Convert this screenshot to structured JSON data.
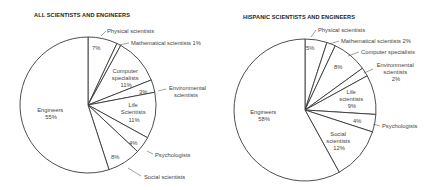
{
  "chart_data": [
    {
      "type": "pie",
      "title": "ALL SCIENTISTS AND ENGINEERS",
      "start": "12 o'clock, clockwise",
      "categories": [
        "Physical scientists",
        "Mathematical scientists",
        "Computer specialists",
        "Environmental scientists",
        "Life Scientists",
        "Psychologists",
        "Social scientists",
        "Engineers"
      ],
      "values": [
        7,
        1,
        11,
        3,
        11,
        4,
        8,
        55
      ],
      "value_labels": [
        "7%",
        "1%",
        "11%",
        "3%",
        "11%",
        "4%",
        "8%",
        "55%"
      ]
    },
    {
      "type": "pie",
      "title": "HISPANIC SCIENTISTS AND ENGINEERS",
      "start": "12 o'clock, clockwise",
      "categories": [
        "Physical scientists",
        "Mathematical scientists",
        "Computer specialists",
        "Environmental scientists",
        "Life scientists",
        "Psychologists",
        "Social scientists",
        "Engineers"
      ],
      "values": [
        5,
        2,
        8,
        2,
        9,
        4,
        12,
        58
      ],
      "value_labels": [
        "5%",
        "2%",
        "8%",
        "2%",
        "9%",
        "4%",
        "12%",
        "58%"
      ]
    }
  ],
  "left": {
    "title": "ALL SCIENTISTS AND ENGINEERS",
    "labels": {
      "physical": "Physical scientists",
      "physical_pct": "7%",
      "math": "Mathematical scientists 1%",
      "computer_1": "Computer",
      "computer_2": "specialists",
      "computer_pct": "11%",
      "env_pct": "3%",
      "env_1": "Environmental",
      "env_2": "scientists",
      "life_1": "Life",
      "life_2": "Scientists",
      "life_pct": "11%",
      "psych_pct": "4%",
      "psych": "Psychologists",
      "social_pct": "8%",
      "social": "Social scientists",
      "eng": "Engineers",
      "eng_pct": "55%"
    }
  },
  "right": {
    "title": "HISPANIC SCIENTISTS AND ENGINEERS",
    "labels": {
      "physical": "Physical scientists",
      "physical_pct": "5%",
      "math": "Mathematical scientists 2%",
      "computer": "Computer specialists",
      "computer_pct": "8%",
      "env_1": "Environmental",
      "env_2": "scientists",
      "env_pct": "2%",
      "life_1": "Life",
      "life_2": "scientists",
      "life_pct": "9%",
      "psych_pct": "4%",
      "psych": "Psychologists",
      "social_1": "Social",
      "social_2": "scientists",
      "social_pct": "12%",
      "eng": "Engineers",
      "eng_pct": "58%"
    }
  }
}
